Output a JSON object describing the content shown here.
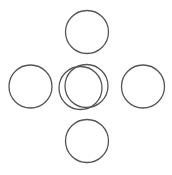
{
  "diagram": {
    "stroke_color": "#555555",
    "stroke_width": 1.3,
    "background": "#ffffff",
    "circles": [
      {
        "name": "circle-top",
        "cx": 87,
        "cy": 32,
        "r": 21.5
      },
      {
        "name": "circle-left",
        "cx": 30.5,
        "cy": 86.5,
        "r": 21.5
      },
      {
        "name": "circle-center-back",
        "cx": 86.5,
        "cy": 86,
        "r": 21.5
      },
      {
        "name": "circle-center-front",
        "cx": 80.5,
        "cy": 88,
        "r": 21.5
      },
      {
        "name": "circle-right",
        "cx": 143,
        "cy": 86.5,
        "r": 21.5
      },
      {
        "name": "circle-bottom",
        "cx": 87,
        "cy": 141,
        "r": 21.5
      }
    ]
  }
}
